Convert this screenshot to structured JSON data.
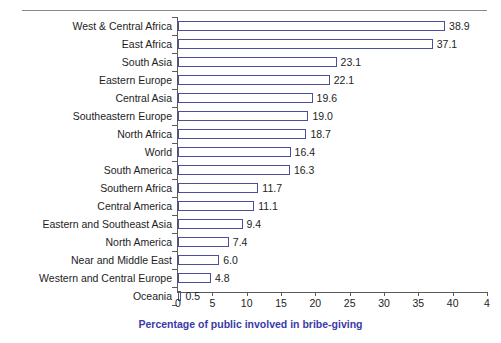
{
  "chart_data": {
    "type": "bar",
    "orientation": "horizontal",
    "title": "",
    "xlabel": "Percentage of public involved in bribe-giving",
    "ylabel": "",
    "xlim": [
      0,
      45
    ],
    "xticks": [
      0,
      5,
      10,
      15,
      20,
      25,
      30,
      35,
      40,
      45
    ],
    "xtick_labels": [
      "0",
      "5",
      "10",
      "15",
      "20",
      "25",
      "30",
      "35",
      "40",
      "4"
    ],
    "grid": false,
    "legend": null,
    "bar_color": "#7a7fd0",
    "axis_title_color": "#3a3aa8",
    "categories": [
      "West & Central Africa",
      "East Africa",
      "South Asia",
      "Eastern Europe",
      "Central Asia",
      "Southeastern Europe",
      "North Africa",
      "World",
      "South America",
      "Southern Africa",
      "Central America",
      "Eastern and Southeast Asia",
      "North America",
      "Near and Middle East",
      "Western and Central Europe",
      "Oceania"
    ],
    "values": [
      38.9,
      37.1,
      23.1,
      22.1,
      19.6,
      19.0,
      18.7,
      16.4,
      16.3,
      11.7,
      11.1,
      9.4,
      7.4,
      6.0,
      4.8,
      0.5
    ],
    "value_labels": [
      "38.9",
      "37.1",
      "23.1",
      "22.1",
      "19.6",
      "19.0",
      "18.7",
      "16.4",
      "16.3",
      "11.7",
      "11.1",
      "9.4",
      "7.4",
      "6.0",
      "4.8",
      "0.5"
    ]
  }
}
